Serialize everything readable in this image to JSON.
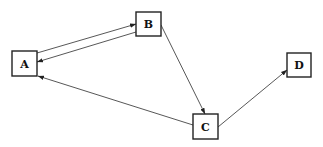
{
  "diagram": {
    "type": "directed-graph",
    "nodes": [
      {
        "id": "A",
        "label": "A",
        "x": 12,
        "y": 51,
        "w": 25,
        "h": 25
      },
      {
        "id": "B",
        "label": "B",
        "x": 136,
        "y": 12,
        "w": 25,
        "h": 24
      },
      {
        "id": "C",
        "label": "C",
        "x": 193,
        "y": 114,
        "w": 25,
        "h": 25
      },
      {
        "id": "D",
        "label": "D",
        "x": 287,
        "y": 53,
        "w": 24,
        "h": 24
      }
    ],
    "edges": [
      {
        "from": "A",
        "to": "B",
        "x1": 37,
        "y1": 53,
        "x2": 136,
        "y2": 24
      },
      {
        "from": "B",
        "to": "A",
        "x1": 136,
        "y1": 32,
        "x2": 37,
        "y2": 62
      },
      {
        "from": "B",
        "to": "C",
        "x1": 161,
        "y1": 25,
        "x2": 205,
        "y2": 114
      },
      {
        "from": "C",
        "to": "A",
        "x1": 193,
        "y1": 125,
        "x2": 38,
        "y2": 76
      },
      {
        "from": "C",
        "to": "D",
        "x1": 218,
        "y1": 127,
        "x2": 287,
        "y2": 70
      }
    ]
  }
}
